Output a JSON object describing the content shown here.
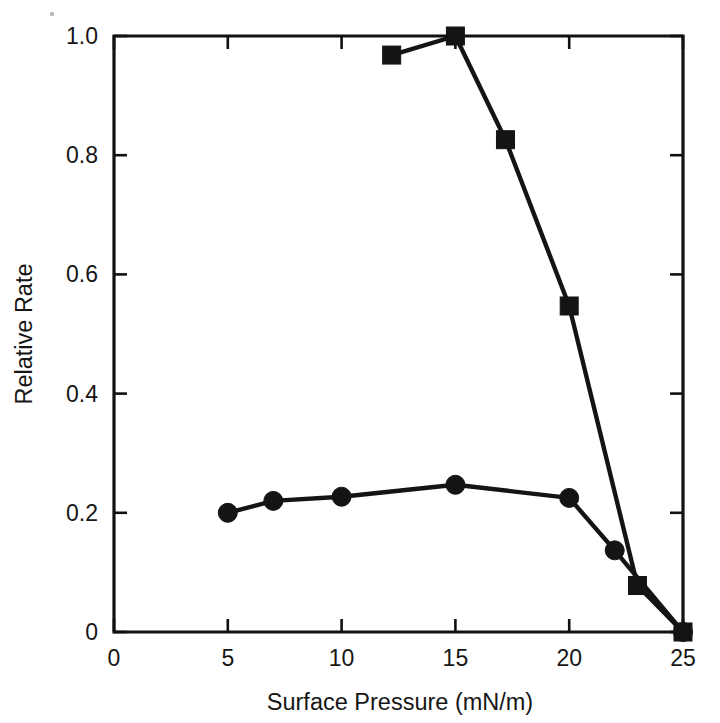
{
  "figure": {
    "background_color": "#ffffff",
    "ink_color": "#141414"
  },
  "chart_data": {
    "type": "line",
    "title": "",
    "subtitle": "",
    "xlabel": "Surface Pressure (mN/m)",
    "ylabel": "Relative Rate",
    "xlim": [
      0,
      25
    ],
    "ylim": [
      0,
      1.0
    ],
    "xticks": [
      0,
      5,
      10,
      15,
      20,
      25
    ],
    "xtick_labels": [
      "0",
      "5",
      "10",
      "15",
      "20",
      "25"
    ],
    "yticks": [
      0,
      0.2,
      0.4,
      0.6,
      0.8,
      1.0
    ],
    "ytick_labels": [
      "0",
      "0.2",
      "0.4",
      "0.6",
      "0.8",
      "1.0"
    ],
    "grid": false,
    "legend": null,
    "legend_position": "none",
    "annotations": [],
    "series": [
      {
        "name": "squares",
        "marker": "filled-square",
        "color": "#141414",
        "x": [
          12.2,
          15.0,
          17.2,
          20.0,
          23.0,
          25.0
        ],
        "y": [
          0.968,
          1.0,
          0.826,
          0.547,
          0.078,
          0.0
        ]
      },
      {
        "name": "circles",
        "marker": "filled-circle",
        "color": "#141414",
        "x": [
          5.0,
          7.0,
          10.0,
          15.0,
          20.0,
          22.0,
          25.0
        ],
        "y": [
          0.2,
          0.22,
          0.227,
          0.247,
          0.225,
          0.137,
          0.0
        ]
      }
    ]
  }
}
